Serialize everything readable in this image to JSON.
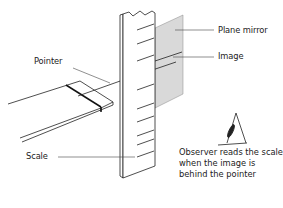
{
  "diagram": {
    "labels": {
      "plane_mirror": "Plane mirror",
      "image": "Image",
      "pointer": "Pointer",
      "scale": "Scale",
      "observer": "Observer reads the scale when the image is behind the pointer"
    },
    "caption_fragment": "",
    "colors": {
      "line": "#222222",
      "mirror_fill": "#d9d9d9",
      "background": "#ffffff"
    },
    "icons": [
      "eye-icon"
    ]
  }
}
